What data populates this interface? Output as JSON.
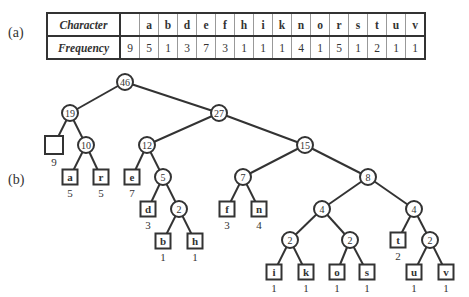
{
  "labels": {
    "part_a": "(a)",
    "part_b": "(b)"
  },
  "table": {
    "row_headers": [
      "Character",
      "Frequency"
    ],
    "columns": [
      {
        "char": "",
        "freq": "9"
      },
      {
        "char": "a",
        "freq": "5"
      },
      {
        "char": "b",
        "freq": "1"
      },
      {
        "char": "d",
        "freq": "3"
      },
      {
        "char": "e",
        "freq": "7"
      },
      {
        "char": "f",
        "freq": "3"
      },
      {
        "char": "h",
        "freq": "1"
      },
      {
        "char": "i",
        "freq": "1"
      },
      {
        "char": "k",
        "freq": "1"
      },
      {
        "char": "n",
        "freq": "4"
      },
      {
        "char": "o",
        "freq": "1"
      },
      {
        "char": "r",
        "freq": "5"
      },
      {
        "char": "s",
        "freq": "1"
      },
      {
        "char": "t",
        "freq": "2"
      },
      {
        "char": "u",
        "freq": "1"
      },
      {
        "char": "v",
        "freq": "1"
      }
    ]
  },
  "tree": {
    "internal_nodes": [
      {
        "id": "n46",
        "weight": "46",
        "x": 125,
        "y": 82
      },
      {
        "id": "n19",
        "weight": "19",
        "x": 70,
        "y": 113
      },
      {
        "id": "n27",
        "weight": "27",
        "x": 219,
        "y": 113
      },
      {
        "id": "n10",
        "weight": "10",
        "x": 86,
        "y": 145
      },
      {
        "id": "n12",
        "weight": "12",
        "x": 147,
        "y": 145
      },
      {
        "id": "n15",
        "weight": "15",
        "x": 305,
        "y": 145
      },
      {
        "id": "n5",
        "weight": "5",
        "x": 163,
        "y": 177
      },
      {
        "id": "n7",
        "weight": "7",
        "x": 243,
        "y": 177
      },
      {
        "id": "n8",
        "weight": "8",
        "x": 368,
        "y": 177
      },
      {
        "id": "n2a",
        "weight": "2",
        "x": 179,
        "y": 209
      },
      {
        "id": "n4a",
        "weight": "4",
        "x": 322,
        "y": 209
      },
      {
        "id": "n4b",
        "weight": "4",
        "x": 414,
        "y": 209
      },
      {
        "id": "n2b",
        "weight": "2",
        "x": 290,
        "y": 240
      },
      {
        "id": "n2c",
        "weight": "2",
        "x": 350,
        "y": 240
      },
      {
        "id": "n2d",
        "weight": "2",
        "x": 430,
        "y": 240
      }
    ],
    "leaves": [
      {
        "id": "l_space",
        "char": "",
        "freq": "9",
        "x": 54,
        "y": 145
      },
      {
        "id": "l_a",
        "char": "a",
        "freq": "5",
        "x": 70,
        "y": 177
      },
      {
        "id": "l_r",
        "char": "r",
        "freq": "5",
        "x": 101,
        "y": 177
      },
      {
        "id": "l_e",
        "char": "e",
        "freq": "7",
        "x": 132,
        "y": 177
      },
      {
        "id": "l_d",
        "char": "d",
        "freq": "3",
        "x": 148,
        "y": 209
      },
      {
        "id": "l_f",
        "char": "f",
        "freq": "3",
        "x": 227,
        "y": 209
      },
      {
        "id": "l_n",
        "char": "n",
        "freq": "4",
        "x": 259,
        "y": 209
      },
      {
        "id": "l_b",
        "char": "b",
        "freq": "1",
        "x": 163,
        "y": 241
      },
      {
        "id": "l_h",
        "char": "h",
        "freq": "1",
        "x": 195,
        "y": 241
      },
      {
        "id": "l_t",
        "char": "t",
        "freq": "2",
        "x": 398,
        "y": 240
      },
      {
        "id": "l_i",
        "char": "i",
        "freq": "1",
        "x": 274,
        "y": 272
      },
      {
        "id": "l_k",
        "char": "k",
        "freq": "1",
        "x": 306,
        "y": 272
      },
      {
        "id": "l_o",
        "char": "o",
        "freq": "1",
        "x": 337,
        "y": 272
      },
      {
        "id": "l_s",
        "char": "s",
        "freq": "1",
        "x": 367,
        "y": 272
      },
      {
        "id": "l_u",
        "char": "u",
        "freq": "1",
        "x": 414,
        "y": 272
      },
      {
        "id": "l_v",
        "char": "v",
        "freq": "1",
        "x": 446,
        "y": 272
      }
    ],
    "edges": [
      [
        "n46",
        "n19"
      ],
      [
        "n46",
        "n27"
      ],
      [
        "n19",
        "l_space"
      ],
      [
        "n19",
        "n10"
      ],
      [
        "n10",
        "l_a"
      ],
      [
        "n10",
        "l_r"
      ],
      [
        "n27",
        "n12"
      ],
      [
        "n27",
        "n15"
      ],
      [
        "n12",
        "l_e"
      ],
      [
        "n12",
        "n5"
      ],
      [
        "n5",
        "l_d"
      ],
      [
        "n5",
        "n2a"
      ],
      [
        "n2a",
        "l_b"
      ],
      [
        "n2a",
        "l_h"
      ],
      [
        "n15",
        "n7"
      ],
      [
        "n15",
        "n8"
      ],
      [
        "n7",
        "l_f"
      ],
      [
        "n7",
        "l_n"
      ],
      [
        "n8",
        "n4a"
      ],
      [
        "n8",
        "n4b"
      ],
      [
        "n4a",
        "n2b"
      ],
      [
        "n4a",
        "n2c"
      ],
      [
        "n2b",
        "l_i"
      ],
      [
        "n2b",
        "l_k"
      ],
      [
        "n2c",
        "l_o"
      ],
      [
        "n2c",
        "l_s"
      ],
      [
        "n4b",
        "l_t"
      ],
      [
        "n4b",
        "n2d"
      ],
      [
        "n2d",
        "l_u"
      ],
      [
        "n2d",
        "l_v"
      ]
    ]
  }
}
